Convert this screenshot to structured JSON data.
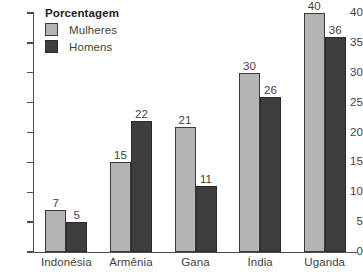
{
  "chart_data": {
    "type": "bar",
    "title": "",
    "subtitle": "",
    "xlabel": "",
    "ylabel": "",
    "categories": [
      "Indonésia",
      "Armênia",
      "Gana",
      "Índia",
      "Uganda"
    ],
    "series": [
      {
        "name": "Mulheres",
        "color": "#b4b4b4",
        "values": [
          7,
          15,
          21,
          30,
          40
        ]
      },
      {
        "name": "Homens",
        "color": "#3e3e3e",
        "values": [
          5,
          22,
          11,
          26,
          36
        ]
      }
    ],
    "ylim": [
      0,
      40
    ],
    "y_ticks": [
      0,
      5,
      10,
      15,
      20,
      25,
      30,
      35,
      40
    ],
    "y_tick_labels": [
      "0",
      "5",
      "10",
      "15",
      "20",
      "25",
      "30",
      "35",
      "40"
    ],
    "grid": false,
    "legend_position": "top-left",
    "legend_title": "Porcentagem",
    "value_labels_shown": true
  },
  "legend": {
    "title": "Porcentagem",
    "entries": [
      {
        "label": "Mulheres",
        "color": "#b4b4b4"
      },
      {
        "label": "Homens",
        "color": "#3e3e3e"
      }
    ]
  },
  "axis": {
    "y_tick_labels": [
      "40",
      "35",
      "30",
      "25",
      "20",
      "15",
      "10",
      "5",
      "0"
    ]
  },
  "categories": [
    "Indonésia",
    "Armênia",
    "Gana",
    "Índia",
    "Uganda"
  ],
  "values": {
    "indonesia": {
      "mulheres": "7",
      "homens": "5"
    },
    "armenia": {
      "mulheres": "15",
      "homens": "22"
    },
    "gana": {
      "mulheres": "21",
      "homens": "11"
    },
    "india": {
      "mulheres": "30",
      "homens": "26"
    },
    "uganda": {
      "mulheres": "40",
      "homens": "36"
    }
  }
}
